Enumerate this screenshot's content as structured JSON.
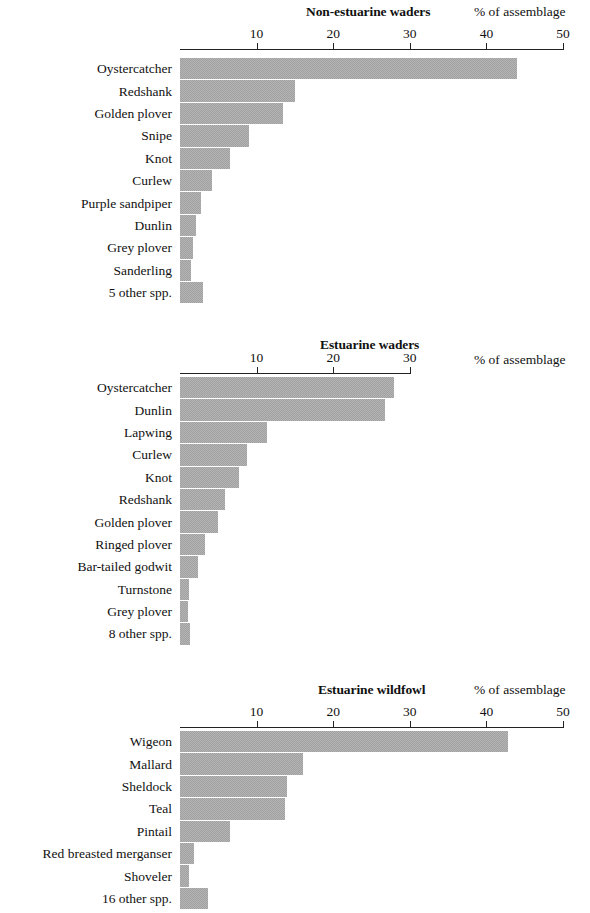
{
  "figure": {
    "axis_label": "% of assemblage",
    "bar_color": "#a0a0a0",
    "axis_color": "#222222"
  },
  "chart_data": [
    {
      "type": "bar",
      "orientation": "horizontal",
      "title": "Non-estuarine waders",
      "xlabel": "% of assemblage",
      "ylabel": "",
      "xlim": [
        0,
        50
      ],
      "xticks": [
        10,
        20,
        30,
        40,
        50
      ],
      "xtick_labels": [
        "10",
        "20",
        "30",
        "40",
        "50"
      ],
      "grid": false,
      "legend": null,
      "categories": [
        "Oystercatcher",
        "Redshank",
        "Golden plover",
        "Snipe",
        "Knot",
        "Curlew",
        "Purple sandpiper",
        "Dunlin",
        "Grey plover",
        "Sanderling",
        "5 other spp."
      ],
      "values": [
        44.0,
        15.0,
        13.5,
        9.0,
        6.5,
        4.2,
        2.7,
        2.1,
        1.7,
        1.4,
        3.0
      ]
    },
    {
      "type": "bar",
      "orientation": "horizontal",
      "title": "Estuarine waders",
      "xlabel": "% of assemblage",
      "ylabel": "",
      "xlim": [
        0,
        30
      ],
      "xticks": [
        10,
        20,
        30
      ],
      "xtick_labels": [
        "10",
        "20",
        "30"
      ],
      "grid": false,
      "legend": null,
      "categories": [
        "Oystercatcher",
        "Dunlin",
        "Lapwing",
        "Curlew",
        "Knot",
        "Redshank",
        "Golden plover",
        "Ringed plover",
        "Bar-tailed godwit",
        "Turnstone",
        "Grey plover",
        "8 other spp."
      ],
      "values": [
        28.0,
        26.8,
        11.4,
        8.7,
        7.7,
        5.9,
        5.0,
        3.3,
        2.4,
        1.2,
        1.1,
        1.3
      ]
    },
    {
      "type": "bar",
      "orientation": "horizontal",
      "title": "Estuarine wildfowl",
      "xlabel": "% of assemblage",
      "ylabel": "",
      "xlim": [
        0,
        50
      ],
      "xticks": [
        10,
        20,
        30,
        40,
        50
      ],
      "xtick_labels": [
        "10",
        "20",
        "30",
        "40",
        "50"
      ],
      "grid": false,
      "legend": null,
      "categories": [
        "Wigeon",
        "Mallard",
        "Sheldock",
        "Teal",
        "Pintail",
        "Red breasted merganser",
        "Shoveler",
        "16 other spp."
      ],
      "values": [
        42.8,
        16.0,
        14.0,
        13.7,
        6.5,
        1.8,
        1.2,
        3.7
      ]
    }
  ]
}
